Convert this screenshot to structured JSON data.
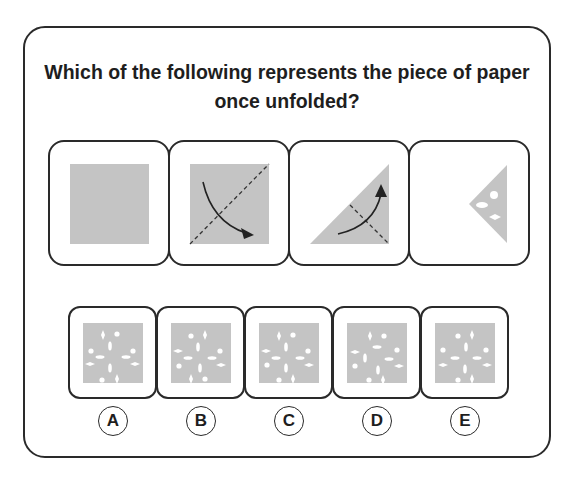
{
  "question": {
    "line1": "Which of the following represents the piece of paper",
    "line2": "once unfolded?"
  },
  "colors": {
    "paper": "#c4c4c4",
    "hole": "#ffffff",
    "border": "#2a2a2a",
    "text": "#1e1e1e"
  },
  "fold_steps": [
    {
      "name": "unfolded-square",
      "description": "Full square sheet of paper"
    },
    {
      "name": "diagonal-fold",
      "description": "Square with dashed diagonal fold line, arrow folding top-left over to bottom-right"
    },
    {
      "name": "second-fold",
      "description": "Right triangle with dashed fold line, arrow folding up"
    },
    {
      "name": "punched-triangle",
      "description": "Folded triangle with three punched holes: one circle, two diamond/oval shapes"
    }
  ],
  "options": [
    {
      "letter": "A"
    },
    {
      "letter": "B"
    },
    {
      "letter": "C"
    },
    {
      "letter": "D"
    },
    {
      "letter": "E"
    }
  ]
}
